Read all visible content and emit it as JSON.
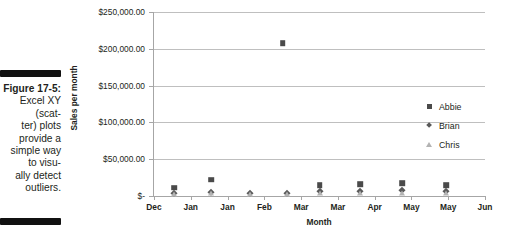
{
  "figure": {
    "label": "Figure 17-5:",
    "caption": "Excel XY (scatter) plots provide a simple way to visually detect outliers.",
    "caption_lines": [
      "Excel XY",
      "(scat-",
      "ter) plots",
      "provide a",
      "simple way",
      "to visu-",
      "ally detect",
      "outliers."
    ]
  },
  "chart_data": {
    "type": "scatter",
    "title": "",
    "xlabel": "Month",
    "ylabel": "Sales per month",
    "ylim": [
      0,
      250000
    ],
    "yticks": [
      0,
      50000,
      100000,
      150000,
      200000,
      250000
    ],
    "ytick_labels": [
      "$-",
      "$50,000.00",
      "$100,000.00",
      "$150,000.00",
      "$200,000.00",
      "$250,000.00"
    ],
    "xtick_labels": [
      "Dec",
      "Jan",
      "Jan",
      "Feb",
      "Mar",
      "Mar",
      "Apr",
      "May",
      "May",
      "Jun"
    ],
    "grid": true,
    "legend_position": "right",
    "series": [
      {
        "name": "Abbie",
        "marker": "square",
        "color": "#4a4a4a",
        "points": [
          {
            "x": 0.55,
            "y": 11000
          },
          {
            "x": 1.55,
            "y": 22000
          },
          {
            "x": 3.5,
            "y": 208000
          },
          {
            "x": 4.5,
            "y": 15000
          },
          {
            "x": 5.6,
            "y": 16000
          },
          {
            "x": 6.75,
            "y": 17000
          },
          {
            "x": 7.95,
            "y": 14500
          }
        ]
      },
      {
        "name": "Brian",
        "marker": "diamond",
        "color": "#595959",
        "points": [
          {
            "x": 0.55,
            "y": 4200
          },
          {
            "x": 1.55,
            "y": 4800
          },
          {
            "x": 2.6,
            "y": 4600
          },
          {
            "x": 3.62,
            "y": 4500
          },
          {
            "x": 4.5,
            "y": 6200
          },
          {
            "x": 5.6,
            "y": 7000
          },
          {
            "x": 6.75,
            "y": 7600
          },
          {
            "x": 7.95,
            "y": 6400
          }
        ]
      },
      {
        "name": "Chris",
        "marker": "triangle",
        "color": "#b3b3b3",
        "points": [
          {
            "x": 0.55,
            "y": 2600
          },
          {
            "x": 1.55,
            "y": 3400
          },
          {
            "x": 2.6,
            "y": 2800
          },
          {
            "x": 3.62,
            "y": 2600
          },
          {
            "x": 4.5,
            "y": 4200
          },
          {
            "x": 5.6,
            "y": 4000
          },
          {
            "x": 6.75,
            "y": 4300
          },
          {
            "x": 7.95,
            "y": 3600
          }
        ]
      }
    ]
  },
  "legend": {
    "items": [
      {
        "label": "Abbie",
        "marker": "square"
      },
      {
        "label": "Brian",
        "marker": "diamond"
      },
      {
        "label": "Chris",
        "marker": "triangle"
      }
    ]
  }
}
